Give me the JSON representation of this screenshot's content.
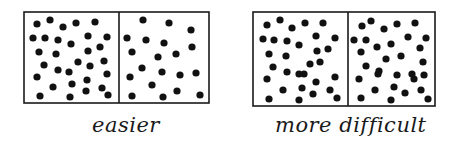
{
  "panels": [
    {
      "label": "easier",
      "label_pos": {
        "x": 92,
        "y": 113
      },
      "box": {
        "x": 24,
        "y": 12,
        "w": 185,
        "h": 91,
        "divider_x": 119
      },
      "left_dots": [
        [
          37,
          24
        ],
        [
          50,
          20
        ],
        [
          63,
          27
        ],
        [
          76,
          23
        ],
        [
          95,
          22
        ],
        [
          33,
          38
        ],
        [
          45,
          38
        ],
        [
          58,
          40
        ],
        [
          71,
          44
        ],
        [
          88,
          36
        ],
        [
          107,
          37
        ],
        [
          39,
          52
        ],
        [
          56,
          54
        ],
        [
          88,
          51
        ],
        [
          100,
          47
        ],
        [
          44,
          65
        ],
        [
          58,
          70
        ],
        [
          78,
          62
        ],
        [
          104,
          61
        ],
        [
          37,
          77
        ],
        [
          69,
          72
        ],
        [
          90,
          66
        ],
        [
          107,
          74
        ],
        [
          53,
          87
        ],
        [
          72,
          84
        ],
        [
          87,
          80
        ],
        [
          86,
          91
        ],
        [
          102,
          88
        ],
        [
          40,
          96
        ],
        [
          70,
          97
        ],
        [
          108,
          95
        ]
      ],
      "right_dots": [
        [
          143,
          20
        ],
        [
          169,
          23
        ],
        [
          191,
          30
        ],
        [
          127,
          38
        ],
        [
          146,
          40
        ],
        [
          164,
          43
        ],
        [
          192,
          47
        ],
        [
          132,
          52
        ],
        [
          158,
          57
        ],
        [
          176,
          54
        ],
        [
          142,
          68
        ],
        [
          162,
          72
        ],
        [
          180,
          75
        ],
        [
          196,
          73
        ],
        [
          130,
          77
        ],
        [
          152,
          85
        ],
        [
          177,
          91
        ],
        [
          132,
          96
        ],
        [
          163,
          97
        ],
        [
          200,
          95
        ]
      ]
    },
    {
      "label": "more difficult",
      "label_pos": {
        "x": 275,
        "y": 113
      },
      "box": {
        "x": 253,
        "y": 12,
        "w": 182,
        "h": 94,
        "divider_x": 348
      },
      "left_dots": [
        [
          267,
          25
        ],
        [
          280,
          20
        ],
        [
          292,
          28
        ],
        [
          305,
          23
        ],
        [
          323,
          23
        ],
        [
          263,
          39
        ],
        [
          274,
          40
        ],
        [
          287,
          41
        ],
        [
          299,
          45
        ],
        [
          316,
          36
        ],
        [
          335,
          38
        ],
        [
          269,
          54
        ],
        [
          286,
          56
        ],
        [
          317,
          51
        ],
        [
          328,
          49
        ],
        [
          273,
          67
        ],
        [
          287,
          72
        ],
        [
          304,
          74
        ],
        [
          310,
          64
        ],
        [
          320,
          62
        ],
        [
          267,
          79
        ],
        [
          299,
          74
        ],
        [
          316,
          82
        ],
        [
          335,
          77
        ],
        [
          283,
          90
        ],
        [
          302,
          88
        ],
        [
          313,
          94
        ],
        [
          330,
          90
        ],
        [
          269,
          99
        ],
        [
          299,
          100
        ],
        [
          337,
          98
        ]
      ],
      "right_dots": [
        [
          362,
          26
        ],
        [
          371,
          21
        ],
        [
          384,
          29
        ],
        [
          397,
          24
        ],
        [
          415,
          23
        ],
        [
          354,
          40
        ],
        [
          366,
          40
        ],
        [
          377,
          47
        ],
        [
          391,
          44
        ],
        [
          408,
          37
        ],
        [
          426,
          38
        ],
        [
          361,
          52
        ],
        [
          386,
          59
        ],
        [
          401,
          56
        ],
        [
          420,
          48
        ],
        [
          366,
          66
        ],
        [
          379,
          71
        ],
        [
          397,
          75
        ],
        [
          412,
          74
        ],
        [
          423,
          62
        ],
        [
          359,
          79
        ],
        [
          378,
          74
        ],
        [
          414,
          79
        ],
        [
          424,
          75
        ],
        [
          375,
          90
        ],
        [
          394,
          87
        ],
        [
          405,
          93
        ],
        [
          421,
          90
        ],
        [
          361,
          98
        ],
        [
          391,
          100
        ],
        [
          428,
          99
        ]
      ]
    }
  ],
  "colors": {
    "ink": "#1a1a1a",
    "dot": "#111111",
    "background": "#ffffff"
  },
  "dot_radius": 3.6
}
